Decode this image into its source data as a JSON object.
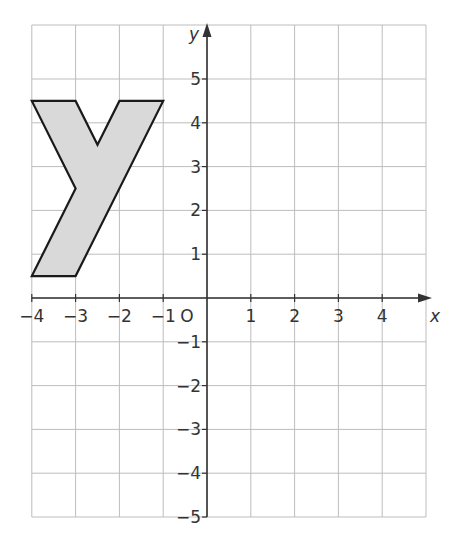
{
  "chart_data": {
    "type": "coordinate-grid",
    "title": "",
    "xlabel": "x",
    "ylabel": "y",
    "xlim": [
      -4,
      5
    ],
    "ylim": [
      -5,
      5.5
    ],
    "grid": true,
    "x_tick_labels": [
      "-4",
      "-3",
      "-2",
      "-1",
      "4",
      "3",
      "2",
      "1"
    ],
    "x_ticks": [
      {
        "v": -4,
        "label": "−4"
      },
      {
        "v": -3,
        "label": "−3"
      },
      {
        "v": -2,
        "label": "−2"
      },
      {
        "v": -1,
        "label": "−1"
      },
      {
        "v": 1,
        "label": "1"
      },
      {
        "v": 2,
        "label": "2"
      },
      {
        "v": 3,
        "label": "3"
      },
      {
        "v": 4,
        "label": "4"
      }
    ],
    "y_ticks": [
      {
        "v": 5,
        "label": "5"
      },
      {
        "v": 4,
        "label": "4"
      },
      {
        "v": 3,
        "label": "3"
      },
      {
        "v": 2,
        "label": "2"
      },
      {
        "v": 1,
        "label": "1"
      },
      {
        "v": -1,
        "label": "−1"
      },
      {
        "v": -2,
        "label": "−2"
      },
      {
        "v": -3,
        "label": "−3"
      },
      {
        "v": -4,
        "label": "−4"
      },
      {
        "v": -5,
        "label": "−5"
      }
    ],
    "origin_label": "O",
    "shape": {
      "name": "letter-y",
      "fill": "#d9d9d9",
      "stroke": "#1a1a1a",
      "vertices": [
        [
          -4,
          4.5
        ],
        [
          -3,
          4.5
        ],
        [
          -2.5,
          3.5
        ],
        [
          -2,
          4.5
        ],
        [
          -1,
          4.5
        ],
        [
          -3,
          0.5
        ],
        [
          -4,
          0.5
        ],
        [
          -3,
          2.5
        ]
      ]
    }
  },
  "labels": {
    "x_axis": "x",
    "y_axis": "y",
    "origin": "O"
  },
  "colors": {
    "grid": "#bdbdbd",
    "axis": "#333333",
    "shape_fill": "#d9d9d9",
    "shape_stroke": "#1a1a1a"
  }
}
